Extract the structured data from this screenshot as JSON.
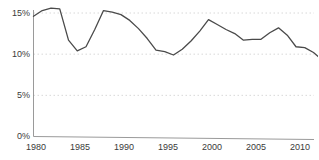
{
  "chart_data": {
    "type": "line",
    "title": "",
    "subtitle": "",
    "xlabel": "",
    "ylabel": "",
    "xlim": [
      1980,
      2013
    ],
    "ylim": [
      0,
      15
    ],
    "grid": true,
    "grid_axis": "y",
    "legend": false,
    "legend_position": "none",
    "x_ticks": [
      1980,
      1985,
      1990,
      1995,
      2000,
      2005,
      2010
    ],
    "x_tick_labels": [
      "1980",
      "1985",
      "1990",
      "1995",
      "2000",
      "2005",
      "2010"
    ],
    "y_ticks": [
      0,
      5,
      10,
      15
    ],
    "y_tick_labels": [
      "0%",
      "5%",
      "10%",
      "15%"
    ],
    "series": [
      {
        "name": "",
        "color": "#4a4a4a",
        "x": [
          1980,
          1981,
          1982,
          1983,
          1984,
          1985,
          1986,
          1987,
          1988,
          1989,
          1990,
          1991,
          1992,
          1993,
          1994,
          1995,
          1996,
          1997,
          1998,
          1999,
          2000,
          2001,
          2002,
          2003,
          2004,
          2005,
          2006,
          2007,
          2008,
          2009,
          2010,
          2011,
          2012,
          2013
        ],
        "values": [
          14.6,
          15.3,
          15.6,
          15.5,
          11.7,
          10.4,
          10.9,
          13.0,
          15.3,
          15.1,
          14.8,
          14.1,
          13.1,
          11.9,
          10.5,
          10.3,
          9.9,
          10.6,
          11.6,
          12.8,
          14.2,
          13.6,
          13.0,
          12.5,
          11.7,
          11.8,
          11.8,
          12.6,
          13.2,
          12.3,
          10.9,
          10.8,
          10.2,
          9.3
        ]
      }
    ]
  },
  "axis": {
    "y_labels": [
      "15%",
      "10%",
      "5%",
      "0%"
    ],
    "x_labels": [
      "1980",
      "1985",
      "1990",
      "1995",
      "2000",
      "2005",
      "2010"
    ]
  },
  "colors": {
    "line": "#4a4a4a",
    "grid": "#d8d8d8",
    "axis": "#9a9a9a",
    "text": "#3a3a3a",
    "background": "#ffffff"
  }
}
